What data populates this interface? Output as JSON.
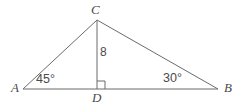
{
  "figure": {
    "type": "geometry-diagram",
    "shape": "triangle-with-altitude",
    "background_color": "#ffffff",
    "line_color": "#6b6b6b",
    "text_color": "#4a4a4a",
    "width": 242,
    "height": 105
  },
  "vertices": {
    "a": {
      "label": "A",
      "x": 23,
      "y": 89
    },
    "b": {
      "label": "B",
      "x": 218,
      "y": 89
    },
    "c": {
      "label": "C",
      "x": 97,
      "y": 20
    },
    "d": {
      "label": "D",
      "x": 97,
      "y": 89
    }
  },
  "segments": [
    {
      "name": "side-ac",
      "from": "a",
      "to": "c"
    },
    {
      "name": "side-cb",
      "from": "c",
      "to": "b"
    },
    {
      "name": "base-ab",
      "from": "a",
      "to": "b"
    },
    {
      "name": "altitude-cd",
      "from": "c",
      "to": "d"
    }
  ],
  "measures": {
    "angle_a": "45°",
    "angle_b": "30°",
    "angle_d": "90°",
    "altitude_length": "8"
  },
  "markers": {
    "right_angle_at_d": true,
    "right_angle_size": 8
  }
}
